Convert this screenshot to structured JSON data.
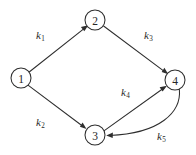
{
  "diagram": {
    "background_color": "#ffffff",
    "ink_color": "#2e2e2e",
    "nodes": [
      {
        "id": "1",
        "label": "1",
        "x": 21,
        "y": 78,
        "r": 10
      },
      {
        "id": "2",
        "label": "2",
        "x": 95,
        "y": 20,
        "r": 10
      },
      {
        "id": "3",
        "label": "3",
        "x": 95,
        "y": 135,
        "r": 10
      },
      {
        "id": "4",
        "label": "4",
        "x": 175,
        "y": 80,
        "r": 10
      }
    ],
    "edges": [
      {
        "id": "e1",
        "from": "1",
        "to": "2",
        "rate": "k",
        "subscript": "1",
        "shape": "straight",
        "label_x": 36,
        "label_y": 30
      },
      {
        "id": "e2",
        "from": "2",
        "to": "4",
        "rate": "k",
        "subscript": "3",
        "shape": "straight",
        "label_x": 144,
        "label_y": 30
      },
      {
        "id": "e3",
        "from": "1",
        "to": "3",
        "rate": "k",
        "subscript": "2",
        "shape": "straight",
        "label_x": 36,
        "label_y": 117
      },
      {
        "id": "e4",
        "from": "3",
        "to": "4",
        "rate": "k",
        "subscript": "4",
        "shape": "straight",
        "label_x": 121,
        "label_y": 87
      },
      {
        "id": "e5",
        "from": "4",
        "to": "3",
        "rate": "k",
        "subscript": "5",
        "shape": "curved",
        "label_x": 157,
        "label_y": 131
      }
    ]
  }
}
